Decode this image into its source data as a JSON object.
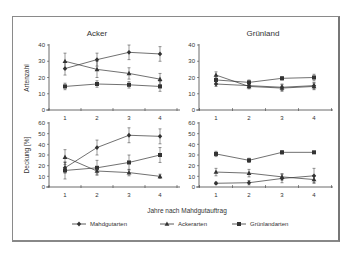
{
  "chart_data": [
    {
      "type": "line",
      "panel": "top-left",
      "title": "Acker",
      "xlabel": "",
      "ylabel": "Artenzahl",
      "x": [
        1,
        2,
        3,
        4
      ],
      "ylim": [
        0,
        40
      ],
      "yticks": [
        0,
        10,
        20,
        30,
        40
      ],
      "series": [
        {
          "name": "Mahdgutarten",
          "marker": "diamond",
          "values": [
            25.5,
            31,
            35.5,
            34.5
          ],
          "err": [
            4,
            4,
            4.5,
            4.5
          ]
        },
        {
          "name": "Ackerarten",
          "marker": "triangle",
          "values": [
            30,
            25,
            22.5,
            19
          ],
          "err": [
            5,
            5,
            3.5,
            3.5
          ]
        },
        {
          "name": "Grünlandarten",
          "marker": "square",
          "values": [
            14.5,
            16,
            15.5,
            14.5
          ],
          "err": [
            2,
            2,
            2,
            3
          ]
        }
      ]
    },
    {
      "type": "line",
      "panel": "top-right",
      "title": "Grünland",
      "xlabel": "",
      "ylabel": "",
      "x": [
        1,
        2,
        3,
        4
      ],
      "ylim": [
        0,
        40
      ],
      "yticks": [
        0,
        10,
        20,
        30,
        40
      ],
      "series": [
        {
          "name": "Mahdgutarten",
          "marker": "diamond",
          "values": [
            16,
            15,
            14,
            15
          ],
          "err": [
            1.5,
            1.5,
            2,
            2
          ]
        },
        {
          "name": "Ackerarten",
          "marker": "triangle",
          "values": [
            21.5,
            14.5,
            13.5,
            14.5
          ],
          "err": [
            2,
            1.5,
            2,
            2
          ]
        },
        {
          "name": "Grünlandarten",
          "marker": "square",
          "values": [
            18.5,
            17,
            19.5,
            20
          ],
          "err": [
            2,
            1.5,
            1,
            2
          ]
        }
      ]
    },
    {
      "type": "line",
      "panel": "bottom-left",
      "title": "",
      "xlabel": "Jahre nach Mahdgutauftrag",
      "ylabel": "Deckung [%]",
      "x": [
        1,
        2,
        3,
        4
      ],
      "ylim": [
        0,
        60
      ],
      "yticks": [
        0,
        10,
        20,
        30,
        40,
        50,
        60
      ],
      "series": [
        {
          "name": "Mahdgutarten",
          "marker": "diamond",
          "values": [
            18,
            37,
            48.5,
            47.5
          ],
          "err": [
            5,
            7,
            7,
            7
          ]
        },
        {
          "name": "Ackerarten",
          "marker": "triangle",
          "values": [
            28,
            15,
            13.5,
            10
          ],
          "err": [
            7,
            3,
            3,
            2
          ]
        },
        {
          "name": "Grünlandarten",
          "marker": "square",
          "values": [
            15.5,
            18,
            23,
            30
          ],
          "err": [
            8,
            7,
            7,
            7
          ]
        }
      ]
    },
    {
      "type": "line",
      "panel": "bottom-right",
      "title": "",
      "xlabel": "Jahre nach Mahdgutauftrag",
      "ylabel": "",
      "x": [
        1,
        2,
        3,
        4
      ],
      "ylim": [
        0,
        60
      ],
      "yticks": [
        0,
        10,
        20,
        30,
        40,
        50,
        60
      ],
      "series": [
        {
          "name": "Mahdgutarten",
          "marker": "diamond",
          "values": [
            3.5,
            4,
            8,
            10.5
          ],
          "err": [
            1,
            2,
            4,
            7
          ]
        },
        {
          "name": "Ackerarten",
          "marker": "triangle",
          "values": [
            14,
            13,
            9.5,
            7
          ],
          "err": [
            3.5,
            3.5,
            3,
            3
          ]
        },
        {
          "name": "Grünlandarten",
          "marker": "square",
          "values": [
            31,
            25,
            32.5,
            32.5
          ],
          "err": [
            2.5,
            2,
            1.5,
            1
          ]
        }
      ]
    }
  ],
  "labels": {
    "title_left": "Acker",
    "title_right": "Grünland",
    "ylabel_top": "Artenzahl",
    "ylabel_bottom": "Deckung [%]",
    "xlabel": "Jahre nach Mahdgutauftrag"
  },
  "legend": [
    {
      "name": "Mahdgutarten",
      "marker": "diamond"
    },
    {
      "name": "Ackerarten",
      "marker": "triangle"
    },
    {
      "name": "Grünlandarten",
      "marker": "square"
    }
  ],
  "colors": {
    "line": "#333333",
    "axis": "#444444",
    "frame": "#8a8a8a"
  }
}
